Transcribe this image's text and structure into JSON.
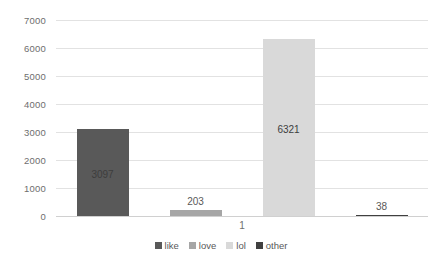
{
  "chart_data": {
    "type": "bar",
    "title": "",
    "subtitle": "",
    "xlabel": "",
    "ylabel": "",
    "categories": [
      "1"
    ],
    "series": [
      {
        "name": "like",
        "values": [
          3097
        ],
        "color": "#595959"
      },
      {
        "name": "love",
        "values": [
          203
        ],
        "color": "#a6a6a6"
      },
      {
        "name": "lol",
        "values": [
          6321
        ],
        "color": "#d9d9d9"
      },
      {
        "name": "other",
        "values": [
          38
        ],
        "color": "#404040"
      }
    ],
    "data_labels": [
      "3097",
      "203",
      "6321",
      "38"
    ],
    "ylim": [
      0,
      7000
    ],
    "ytick_labels": [
      "0",
      "1000",
      "2000",
      "3000",
      "4000",
      "5000",
      "6000",
      "7000"
    ],
    "ytick_values": [
      0,
      1000,
      2000,
      3000,
      4000,
      5000,
      6000,
      7000
    ],
    "grid": true,
    "legend_position": "bottom",
    "legend_entries": [
      "like",
      "love",
      "lol",
      "other"
    ]
  },
  "axes": {
    "y_labels": [
      "7000",
      "6000",
      "5000",
      "4000",
      "3000",
      "2000",
      "1000",
      "0"
    ],
    "x_category": "1"
  },
  "colors": {
    "background": "#ffffff",
    "gridline": "#e2e2e2",
    "axis_text": "#6e6e6e",
    "label_text": "#404040"
  }
}
